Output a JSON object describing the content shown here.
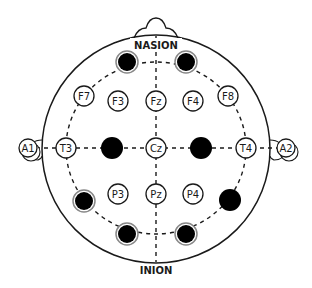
{
  "diagram": {
    "landmarks": {
      "nasion": "NASION",
      "inion": "INION"
    },
    "colors": {
      "line": "#1a1a1a",
      "electrode_fill": "#ffffff",
      "active_fill": "#000000",
      "active_ring": "#888888",
      "background": "#ffffff"
    },
    "electrodes": [
      {
        "label": "F7",
        "x": 84,
        "y": 96,
        "active": false
      },
      {
        "label": "F3",
        "x": 118,
        "y": 101,
        "active": false
      },
      {
        "label": "Fz",
        "x": 156,
        "y": 101,
        "active": false
      },
      {
        "label": "F4",
        "x": 193,
        "y": 101,
        "active": false
      },
      {
        "label": "F8",
        "x": 228,
        "y": 96,
        "active": false
      },
      {
        "label": "T3",
        "x": 66,
        "y": 148,
        "active": false
      },
      {
        "label": "Cz",
        "x": 156,
        "y": 148,
        "active": false
      },
      {
        "label": "T4",
        "x": 246,
        "y": 148,
        "active": false
      },
      {
        "label": "P3",
        "x": 118,
        "y": 194,
        "active": false
      },
      {
        "label": "Pz",
        "x": 156,
        "y": 194,
        "active": false
      },
      {
        "label": "P4",
        "x": 193,
        "y": 194,
        "active": false
      }
    ],
    "ears": [
      {
        "label": "A1",
        "x": 28,
        "y": 148
      },
      {
        "label": "A2",
        "x": 286,
        "y": 148
      }
    ],
    "active_electrodes": [
      {
        "name": "Fp1",
        "x": 127,
        "y": 62
      },
      {
        "name": "Fp2",
        "x": 186,
        "y": 62
      },
      {
        "name": "C3",
        "x": 112,
        "y": 148
      },
      {
        "name": "C4",
        "x": 201,
        "y": 148
      },
      {
        "name": "T5",
        "x": 84,
        "y": 201
      },
      {
        "name": "T6",
        "x": 230,
        "y": 200
      },
      {
        "name": "O1",
        "x": 127,
        "y": 234
      },
      {
        "name": "O2",
        "x": 186,
        "y": 234
      }
    ]
  }
}
